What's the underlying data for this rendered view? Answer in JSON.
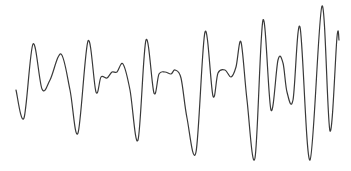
{
  "chart_data": {
    "type": "line",
    "title": "",
    "xlabel": "",
    "ylabel": "",
    "grid": false,
    "axes_visible": false,
    "legend": null,
    "line_color": "#3a3a3a",
    "background": "#ffffff",
    "series": [
      {
        "name": "waveform",
        "points": [
          [
            16,
            90
          ],
          [
            24,
            118
          ],
          [
            33,
            44
          ],
          [
            42,
            89
          ],
          [
            50,
            80
          ],
          [
            61,
            54
          ],
          [
            70,
            90
          ],
          [
            78,
            133
          ],
          [
            88,
            41
          ],
          [
            96,
            92
          ],
          [
            101,
            77
          ],
          [
            107,
            78
          ],
          [
            112,
            72
          ],
          [
            117,
            72
          ],
          [
            123,
            64
          ],
          [
            130,
            90
          ],
          [
            138,
            140
          ],
          [
            146,
            40
          ],
          [
            154,
            93
          ],
          [
            159,
            74
          ],
          [
            165,
            72
          ],
          [
            171,
            74
          ],
          [
            175,
            70
          ],
          [
            181,
            78
          ],
          [
            187,
            118
          ],
          [
            196,
            152
          ],
          [
            205,
            32
          ],
          [
            213,
            96
          ],
          [
            218,
            73
          ],
          [
            225,
            70
          ],
          [
            231,
            77
          ],
          [
            236,
            67
          ],
          [
            241,
            42
          ],
          [
            247,
            100
          ],
          [
            255,
            158
          ],
          [
            263,
            20
          ],
          [
            271,
            110
          ],
          [
            278,
            60
          ],
          [
            283,
            63
          ],
          [
            287,
            92
          ],
          [
            293,
            100
          ],
          [
            300,
            27
          ],
          [
            310,
            160
          ],
          [
            322,
            6
          ],
          [
            330,
            131
          ],
          [
            337,
            37
          ],
          [
            339,
            40
          ]
        ]
      }
    ]
  }
}
